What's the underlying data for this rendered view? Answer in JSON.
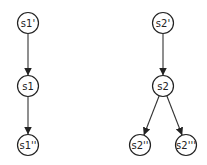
{
  "diagram": {
    "type": "tree",
    "trees": [
      {
        "nodes": [
          {
            "id": "s1p",
            "label": "s1'",
            "x": 28,
            "y": 23
          },
          {
            "id": "s1",
            "label": "s1",
            "x": 28,
            "y": 86
          },
          {
            "id": "s1pp",
            "label": "s1''",
            "x": 28,
            "y": 145
          }
        ],
        "edges": [
          {
            "from": "s1p",
            "to": "s1"
          },
          {
            "from": "s1",
            "to": "s1pp"
          }
        ]
      },
      {
        "nodes": [
          {
            "id": "s2p",
            "label": "s2'",
            "x": 163,
            "y": 23
          },
          {
            "id": "s2",
            "label": "s2",
            "x": 163,
            "y": 86
          },
          {
            "id": "s2pp",
            "label": "s2''",
            "x": 140,
            "y": 145
          },
          {
            "id": "s2ppp",
            "label": "s2'''",
            "x": 186,
            "y": 145
          }
        ],
        "edges": [
          {
            "from": "s2p",
            "to": "s2"
          },
          {
            "from": "s2",
            "to": "s2pp"
          },
          {
            "from": "s2",
            "to": "s2ppp"
          }
        ]
      }
    ]
  }
}
